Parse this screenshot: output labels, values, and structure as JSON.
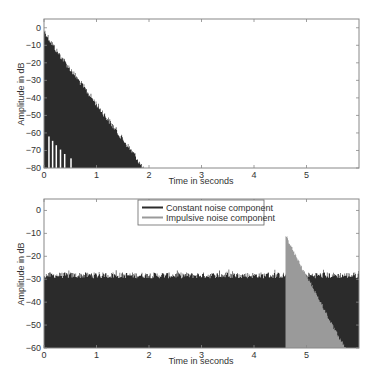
{
  "chart_data": [
    {
      "type": "area",
      "title": "",
      "xlabel": "Time in seconds",
      "ylabel": "Amplitude in dB",
      "xlim": [
        0,
        6
      ],
      "ylim": [
        -80,
        5
      ],
      "xticks": [
        0,
        1,
        2,
        3,
        4,
        5
      ],
      "yticks": [
        0,
        -10,
        -20,
        -30,
        -40,
        -50,
        -60,
        -70,
        -80
      ],
      "grid": false,
      "series": [
        {
          "name": "Decaying impulse response envelope",
          "color": "#2b2b2b",
          "description": "Dense noise-like decay starting near 0 dB at t=0 and decaying roughly linearly to -80 dB at about t=1.9 s",
          "x": [
            0,
            0.1,
            0.25,
            0.5,
            0.75,
            1.0,
            1.25,
            1.5,
            1.75,
            1.9
          ],
          "y": [
            0,
            -5,
            -12,
            -22,
            -32,
            -42,
            -52,
            -62,
            -72,
            -80
          ]
        }
      ]
    },
    {
      "type": "area",
      "title": "",
      "xlabel": "Time in seconds",
      "ylabel": "Amplitude in dB",
      "xlim": [
        0,
        6
      ],
      "ylim": [
        -60,
        5
      ],
      "xticks": [
        0,
        1,
        2,
        3,
        4,
        5
      ],
      "yticks": [
        0,
        -10,
        -20,
        -30,
        -40,
        -50,
        -60
      ],
      "grid": false,
      "legend_position": "top-center",
      "series": [
        {
          "name": "Constant noise component",
          "color": "#2b2b2b",
          "description": "Stationary noise floor around -29 dB (peaks -27 to -30 dB) across 0 to 6 s",
          "x": [
            0,
            1,
            2,
            3,
            4,
            4.6,
            5,
            5.5,
            5.98
          ],
          "y": [
            -29,
            -29,
            -29,
            -29,
            -29,
            -29,
            -29,
            -29,
            -29
          ]
        },
        {
          "name": "Impulsive noise component",
          "color": "#9a9a9a",
          "description": "Impulse onset at about 4.6 s peaking at -10 dB, decaying roughly linearly to -60 dB at about 5.75 s",
          "x": [
            4.6,
            4.7,
            4.9,
            5.1,
            5.3,
            5.5,
            5.75
          ],
          "y": [
            -10,
            -15,
            -24,
            -32,
            -41,
            -50,
            -60
          ]
        }
      ]
    }
  ],
  "plots": {
    "top": {
      "ylabel": "Amplitude in dB",
      "xlabel": "Time in seconds",
      "xtick_labels": [
        "0",
        "1",
        "2",
        "3",
        "4",
        "5"
      ],
      "ytick_labels": [
        "0",
        "-10",
        "-20",
        "-30",
        "-40",
        "-50",
        "-60",
        "-70",
        "-80"
      ]
    },
    "bottom": {
      "ylabel": "Amplitude in dB",
      "xlabel": "Time in seconds",
      "xtick_labels": [
        "0",
        "1",
        "2",
        "3",
        "4",
        "5"
      ],
      "ytick_labels": [
        "0",
        "-10",
        "-20",
        "-30",
        "-40",
        "-50",
        "-60"
      ],
      "legend": [
        {
          "label": "Constant noise component",
          "color": "#2b2b2b"
        },
        {
          "label": "Impulsive noise component",
          "color": "#9a9a9a"
        }
      ]
    }
  }
}
